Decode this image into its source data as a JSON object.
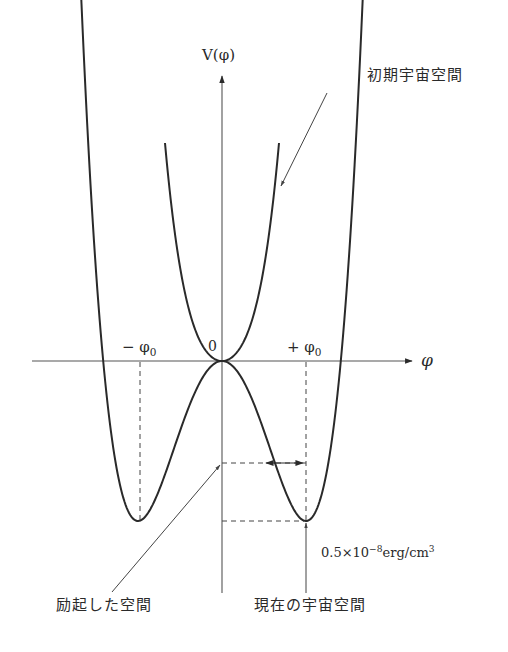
{
  "diagram": {
    "type": "potential-energy-curve",
    "axes": {
      "y_label": "V(φ)",
      "x_label": "φ",
      "origin_label": "0",
      "neg_min_label": "− φ",
      "pos_min_label": "+ φ",
      "min_subscript": "0"
    },
    "curves": [
      {
        "name": "early-universe-potential",
        "shape": "single-well parabola, minimum at φ=0, V=0"
      },
      {
        "name": "current-universe-potential",
        "shape": "double-well (Mexican hat), local max at φ=0, minima at ±φ0"
      }
    ],
    "annotations": {
      "early_universe": "初期宇宙空間",
      "excited_space": "励起した空間",
      "current_universe": "現在の宇宙空間",
      "energy_value": "0.5×10",
      "energy_exponent": "−8",
      "energy_unit": "erg/cm",
      "energy_unit_exponent": "3"
    },
    "colors": {
      "curve": "#2a2a2a",
      "axis": "#555555",
      "background": "#ffffff"
    }
  }
}
